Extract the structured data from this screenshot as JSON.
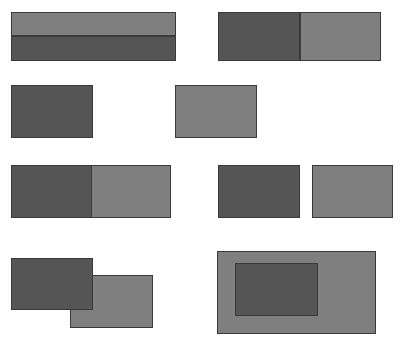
{
  "diagram": {
    "colors": {
      "dark": "#555555",
      "light": "#7f7f7f",
      "border": "#3a3a3a",
      "background": "#ffffff"
    },
    "pairs": [
      {
        "relation": "meets-vertical",
        "rects": [
          {
            "shade": "light",
            "x": 11,
            "y": 12,
            "w": 165,
            "h": 24
          },
          {
            "shade": "dark",
            "x": 11,
            "y": 36,
            "w": 165,
            "h": 25
          }
        ]
      },
      {
        "relation": "meets-horizontal",
        "rects": [
          {
            "shade": "dark",
            "x": 218,
            "y": 12,
            "w": 82,
            "h": 49
          },
          {
            "shade": "light",
            "x": 300,
            "y": 12,
            "w": 81,
            "h": 49
          }
        ]
      },
      {
        "relation": "disjoint-far",
        "rects": [
          {
            "shade": "dark",
            "x": 11,
            "y": 85,
            "w": 82,
            "h": 53
          },
          {
            "shade": "light",
            "x": 175,
            "y": 85,
            "w": 82,
            "h": 53
          }
        ]
      },
      {
        "relation": "touching",
        "rects": [
          {
            "shade": "dark",
            "x": 11,
            "y": 165,
            "w": 82,
            "h": 53
          },
          {
            "shade": "light",
            "x": 91,
            "y": 165,
            "w": 80,
            "h": 53
          }
        ]
      },
      {
        "relation": "disjoint-near",
        "rects": [
          {
            "shade": "dark",
            "x": 218,
            "y": 165,
            "w": 82,
            "h": 53
          },
          {
            "shade": "light",
            "x": 312,
            "y": 165,
            "w": 81,
            "h": 53
          }
        ]
      },
      {
        "relation": "overlaps",
        "rects": [
          {
            "shade": "light",
            "x": 70,
            "y": 275,
            "w": 83,
            "h": 53
          },
          {
            "shade": "dark",
            "x": 11,
            "y": 258,
            "w": 82,
            "h": 52
          }
        ]
      },
      {
        "relation": "contains",
        "rects": [
          {
            "shade": "light",
            "x": 217,
            "y": 251,
            "w": 159,
            "h": 83
          },
          {
            "shade": "dark",
            "x": 235,
            "y": 263,
            "w": 83,
            "h": 53
          }
        ]
      }
    ]
  }
}
